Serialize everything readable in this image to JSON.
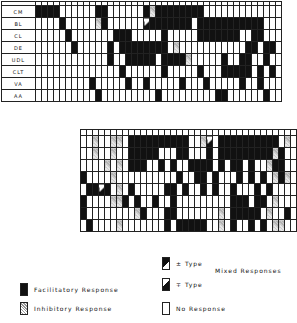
{
  "chart_data": {
    "type": "heatmap",
    "title": "",
    "legend": {
      "F": "Facilitatory Response",
      "I": "Inhibitory Response",
      "P": "± Type",
      "M": "∓ Type",
      "N": "No Response",
      "mixed_label": "Mixed Responses"
    },
    "upper": {
      "rows": [
        "CM",
        "BL",
        "CL",
        "DE",
        "UDL",
        "CLT",
        "VA",
        "AA"
      ],
      "columns": 41,
      "cells": [
        "FFFF......FF......FIFFFFFFFF..........",
        "....F.....IF......MFFFFFFF.FFFFFFFFFFF..",
        ".....F.......FFF.....F.....FFFFFFF..FF..",
        "......F.....F.FFFFFFFF.I...........FF.FF.",
        "............F..FFFFF.FFFFI.....F..FF..F.",
        "..............F......F.....F...FFFFF.F.F",
        ".........F.....F..F.....F...F.....F..F..",
        "..........F.........F.........FF......F."
      ]
    },
    "lower": {
      "columns": 36,
      "cells": [
        "..I..II.FFFFFFFFFF..IM.FFFFFFFFFF.I..",
        "..I..I..FFFFF...FF...F.FFFFFFFFFIF..",
        "....I.I.FFF..F.F..FFFF.F.FF.F..IFF..",
        "F....I..........F..FF.F...F.F.F.IFI.",
        ".FFMF.I.F.....FF.F..F.F..F...F.F....",
        "F....IIF.F..F..F.........FFF.FF.I...",
        "F........IF...FF.......I.FFFFF.I..F.",
        ".F....I.......F.FFFFF..I.F..F.F.II.."
      ]
    }
  }
}
